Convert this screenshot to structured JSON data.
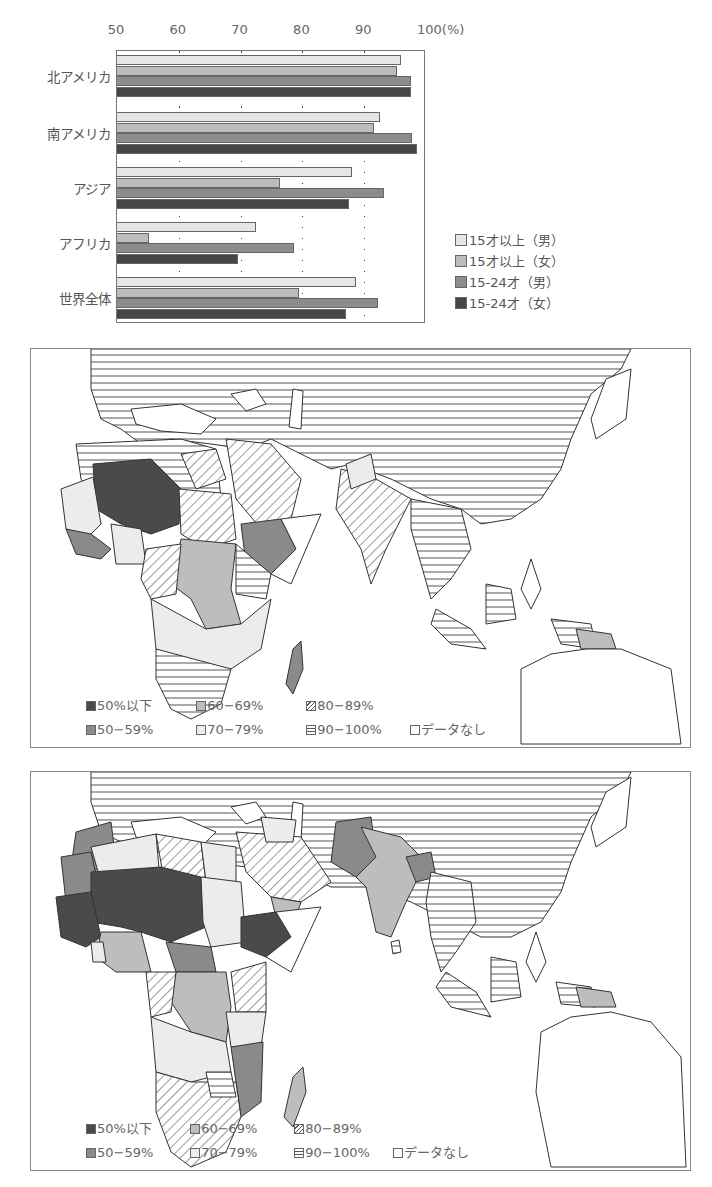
{
  "chart_data": {
    "type": "bar",
    "orientation": "horizontal",
    "title": "",
    "xlabel": "(%)",
    "ylabel": "",
    "xlim": [
      50,
      100
    ],
    "x_ticks": [
      "50",
      "60",
      "70",
      "80",
      "90",
      "100(%)"
    ],
    "grid": "dotted vertical at 60,70,80,90",
    "legend_position": "right-bottom",
    "categories": [
      "北アメリカ",
      "南アメリカ",
      "アジア",
      "アフリカ",
      "世界全体"
    ],
    "series": [
      {
        "name": "15才以上（男）",
        "color": "#e6e6e6",
        "values": [
          96.0,
          92.6,
          88.0,
          72.5,
          88.6
        ]
      },
      {
        "name": "15才以上（女）",
        "color": "#bcbcbc",
        "values": [
          95.3,
          91.6,
          76.4,
          55.1,
          79.5
        ]
      },
      {
        "name": "15-24才（男）",
        "color": "#8c8c8c",
        "values": [
          97.5,
          97.7,
          93.2,
          78.7,
          92.2
        ]
      },
      {
        "name": "15-24才（女）",
        "color": "#464646",
        "values": [
          97.6,
          98.5,
          87.5,
          69.5,
          87.1
        ]
      }
    ]
  },
  "chart": {
    "tick_labels": [
      "50",
      "60",
      "70",
      "80",
      "90",
      "100(%)"
    ],
    "legend": [
      "□15才以上（男）",
      "15才以上（女）",
      "15-24才（男）",
      "15-24才（女）"
    ]
  },
  "maps": [
    {
      "name": "map-upper",
      "legend": {
        "row1": [
          "50%以下",
          "60−69%",
          "80−89%"
        ],
        "row2": [
          "50−59%",
          "70−79%",
          "90−100%",
          "データなし"
        ]
      }
    },
    {
      "name": "map-lower",
      "legend": {
        "row1": [
          "50%以下",
          "60−69%",
          "80−89%"
        ],
        "row2": [
          "50−59%",
          "70−79%",
          "90−100%",
          "データなし"
        ]
      }
    }
  ],
  "colors": {
    "c_le50": "#4a4a4a",
    "c_50_59": "#8a8a8a",
    "c_60_69": "#bdbdbd",
    "c_70_79": "#ececec",
    "line": "#333333"
  }
}
